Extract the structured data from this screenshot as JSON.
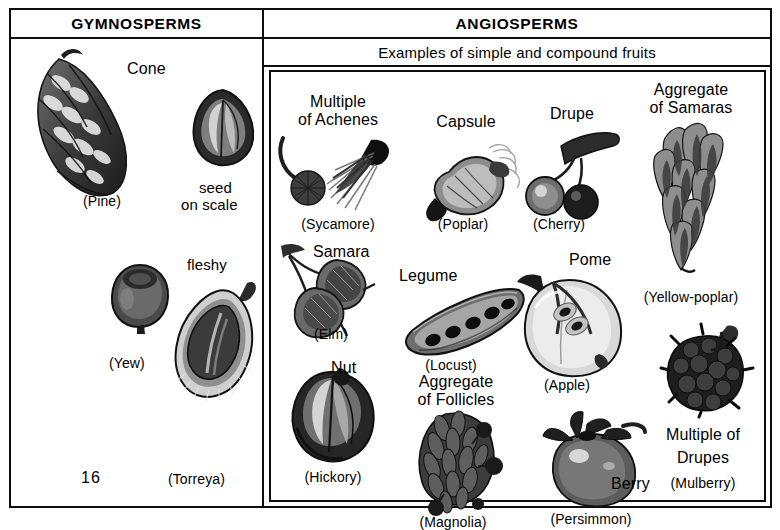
{
  "figure": {
    "page_number": "16",
    "columns": [
      {
        "id": "gymnosperms",
        "header": "GYMNOSPERMS",
        "specimens": [
          {
            "name": "Cone",
            "source": "(Pine)"
          },
          {
            "name": "seed\non scale",
            "source": ""
          },
          {
            "name": "",
            "source": "(Yew)"
          },
          {
            "name": "fleshy",
            "source": "(Torreya)"
          }
        ]
      },
      {
        "id": "angiosperms",
        "header": "ANGIOSPERMS",
        "subheader": "Examples of simple and compound fruits",
        "specimens": [
          {
            "name": "Multiple\nof Achenes",
            "source": "(Sycamore)"
          },
          {
            "name": "Capsule",
            "source": "(Poplar)"
          },
          {
            "name": "Drupe",
            "source": "(Cherry)"
          },
          {
            "name": "Aggregate\nof Samaras",
            "source": "(Yellow-poplar)"
          },
          {
            "name": "Samara",
            "source": "(Elm)"
          },
          {
            "name": "Legume",
            "source": "(Locust)"
          },
          {
            "name": "Pome",
            "source": "(Apple)"
          },
          {
            "name": "Nut",
            "source": "(Hickory)"
          },
          {
            "name": "Aggregate\nof Follicles",
            "source": "(Magnolia)"
          },
          {
            "name": "Berry",
            "source": "(Persimmon)"
          },
          {
            "name": "Multiple of\nDrupes",
            "source": "(Mulberry)"
          }
        ]
      }
    ]
  },
  "labels": {
    "gymno_header": "GYMNOSPERMS",
    "angio_header": "ANGIOSPERMS",
    "angio_subheader": "Examples of simple and compound fruits",
    "cone": "Cone",
    "pine": "(Pine)",
    "seed_on_scale_1": "seed",
    "seed_on_scale_2": "on scale",
    "yew": "(Yew)",
    "fleshy": "fleshy",
    "torreya": "(Torreya)",
    "page_number": "16",
    "multiple_of_achenes_1": "Multiple",
    "multiple_of_achenes_2": "of Achenes",
    "sycamore": "(Sycamore)",
    "capsule": "Capsule",
    "poplar": "(Poplar)",
    "drupe": "Drupe",
    "cherry": "(Cherry)",
    "aggregate_of_samaras_1": "Aggregate",
    "aggregate_of_samaras_2": "of Samaras",
    "yellow_poplar": "(Yellow-poplar)",
    "samara": "Samara",
    "elm": "(Elm)",
    "legume": "Legume",
    "locust": "(Locust)",
    "pome": "Pome",
    "apple": "(Apple)",
    "nut": "Nut",
    "hickory": "(Hickory)",
    "aggregate_of_follicles_1": "Aggregate",
    "aggregate_of_follicles_2": "of Follicles",
    "magnolia": "(Magnolia)",
    "berry": "Berry",
    "persimmon": "(Persimmon)",
    "multiple_of_drupes_1": "Multiple of",
    "multiple_of_drupes_2": "Drupes",
    "mulberry": "(Mulberry)"
  },
  "colors": {
    "ink": "#0d0d0d",
    "paper": "#ffffff",
    "wash_dark": "#3a3a3a",
    "wash_mid": "#6e6e6e",
    "wash_light": "#b4b4b4"
  }
}
